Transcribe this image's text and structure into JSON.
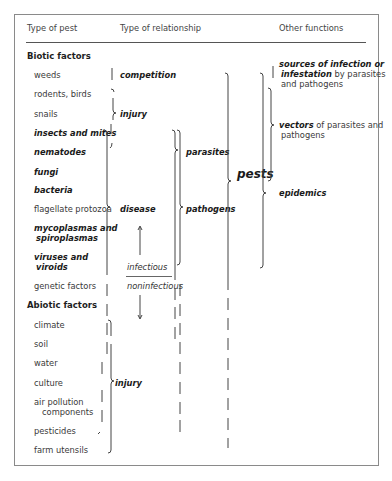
{
  "headers": {
    "type_of_pest": "Type of pest",
    "type_of_relationship": "Type of relationship",
    "other_functions": "Other functions"
  },
  "sections": {
    "biotic": "Biotic factors",
    "abiotic": "Abiotic factors"
  },
  "biotic_pests": [
    {
      "label": "weeds",
      "style": "normal"
    },
    {
      "label": "rodents, birds",
      "style": "normal"
    },
    {
      "label": "snails",
      "style": "normal"
    },
    {
      "label": "insects and mites",
      "style": "bold-italic"
    },
    {
      "label": "nematodes",
      "style": "bold-italic"
    },
    {
      "label": "fungi",
      "style": "bold-italic"
    },
    {
      "label": "bacteria",
      "style": "bold-italic"
    },
    {
      "label": "flagellate protozoa",
      "style": "normal"
    },
    {
      "label": "mycoplasmas and",
      "style": "bold-italic"
    },
    {
      "label": "spiroplasmas",
      "style": "bold-italic"
    },
    {
      "label": "viruses and",
      "style": "bold-italic"
    },
    {
      "label": "viroids",
      "style": "bold-italic"
    },
    {
      "label": "genetic factors",
      "style": "normal"
    }
  ],
  "abiotic_pests": [
    {
      "label": "climate"
    },
    {
      "label": "soil"
    },
    {
      "label": "water"
    },
    {
      "label": "culture"
    },
    {
      "label": "air pollution"
    },
    {
      "label": "components"
    },
    {
      "label": "pesticides"
    },
    {
      "label": "farm utensils"
    }
  ],
  "relationships": {
    "competition": "competition",
    "injury_biotic": "injury",
    "disease": "disease",
    "infectious": "infectious",
    "noninfectious": "noninfectious",
    "injury_abiotic": "injury"
  },
  "groups": {
    "parasites": "parasites",
    "pathogens": "pathogens",
    "pests": "pests"
  },
  "other_functions": {
    "sources_bold": "sources of infection or",
    "infestation_bold": "infestation",
    "sources_rest": " by parasites",
    "sources_line3": "and pathogens",
    "vectors_bold": "vectors",
    "vectors_rest": " of parasites and",
    "vectors_line2": "pathogens",
    "epidemics": "epidemics"
  }
}
